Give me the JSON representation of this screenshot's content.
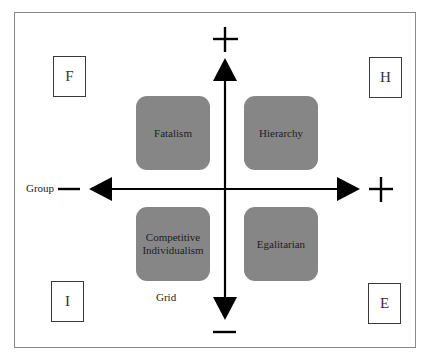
{
  "diagram": {
    "type": "grid-group quadrant diagram",
    "axes": {
      "horizontal": {
        "label": "Group",
        "negative_sign": "—",
        "positive_sign": "+"
      },
      "vertical": {
        "label": "Grid",
        "positive_sign": "+",
        "negative_sign": "—"
      }
    },
    "quadrants": [
      {
        "position": "top-left",
        "label": "Fatalism",
        "corner_letter": "F"
      },
      {
        "position": "top-right",
        "label": "Hierarchy",
        "corner_letter": "H"
      },
      {
        "position": "bottom-left",
        "label": "Competitive Individualism",
        "corner_letter": "I"
      },
      {
        "position": "bottom-right",
        "label": "Egalitarian",
        "corner_letter": "E"
      }
    ],
    "colors": {
      "quadrant_fill": "#868686",
      "axis": "#000000",
      "frame": "#8a8a8a"
    }
  }
}
